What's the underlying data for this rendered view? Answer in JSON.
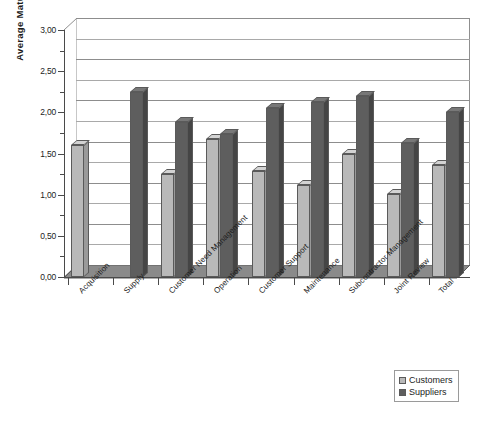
{
  "chart_data": {
    "type": "bar",
    "title": "",
    "xlabel": "",
    "ylabel": "Average Maturity",
    "ylim": [
      0,
      3
    ],
    "ytick_labels": [
      "0,00",
      "0,50",
      "1,00",
      "1,50",
      "2,00",
      "2,50",
      "3,00"
    ],
    "ytick_values": [
      0,
      0.5,
      1.0,
      1.5,
      2.0,
      2.5,
      3.0
    ],
    "ytick_step": 0.5,
    "gridline_step": 0.25,
    "grid": true,
    "legend_position": "bottom-right",
    "style": "3d-clustered-bar",
    "decimal_separator": ",",
    "categories": [
      "Acquisition",
      "Supply",
      "Customer Need Management",
      "Operation",
      "Customer Support",
      "Maintenance",
      "Subcontractor Management",
      "Joint Review",
      "Total"
    ],
    "series": [
      {
        "name": "Customers",
        "color": "#b9b9b9",
        "values": [
          1.6,
          0.0,
          1.25,
          1.68,
          1.29,
          1.12,
          1.49,
          1.01,
          1.36
        ]
      },
      {
        "name": "Suppliers",
        "color": "#5e5e5e",
        "values": [
          0.0,
          2.25,
          1.88,
          1.74,
          2.05,
          2.13,
          2.2,
          1.63,
          2.0
        ]
      }
    ]
  },
  "legend": {
    "items": [
      {
        "label": "Customers"
      },
      {
        "label": "Suppliers"
      }
    ]
  },
  "axes": {
    "y_title": "Average Maturity"
  }
}
